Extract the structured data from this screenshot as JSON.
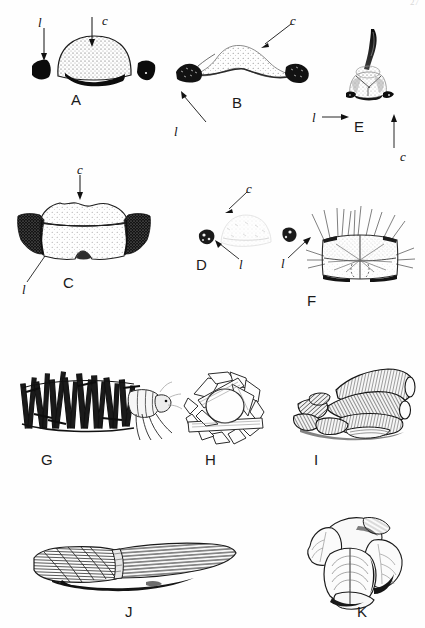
{
  "plate": {
    "kind": "scientific-illustration-plate",
    "background_color": "#fefefe",
    "ink_color": "#111111",
    "width": 425,
    "height": 628,
    "page_number": "27"
  },
  "annotation_legend": {
    "c_label": "c",
    "l_label": "l",
    "c_meaning": "central sclerite / central region",
    "l_meaning": "lateral sclerite"
  },
  "panels": [
    {
      "id": "A",
      "label": "A",
      "subject": "pronotal-sclerite-dorsal-view",
      "description": "Domed stippled central sclerite with dark crescent along its ventral margin and two separate solid-black lateral sclerites.",
      "annotations": [
        {
          "letter": "l",
          "arrow": "down",
          "side": "left"
        },
        {
          "letter": "c",
          "arrow": "down",
          "side": "center"
        }
      ]
    },
    {
      "id": "B",
      "label": "B",
      "subject": "pronotal-sclerite-flattened",
      "description": "Low broad stippled central plate with a pair of solid-black lateral lobes at each end.",
      "annotations": [
        {
          "letter": "c",
          "arrow": "diagonal-down-left",
          "side": "upper-right"
        },
        {
          "letter": "l",
          "arrow": "diagonal-up-right",
          "side": "lower-left"
        }
      ]
    },
    {
      "id": "C",
      "label": "C",
      "subject": "pronotal-sclerite-broad",
      "description": "Large two-tiered stippled central plate with heavily shaded black lateral wings flaring outward and a notch at the ventral midline.",
      "annotations": [
        {
          "letter": "c",
          "arrow": "down",
          "side": "center-top"
        },
        {
          "letter": "l",
          "arrow": "diagonal-up-right",
          "side": "lower-left"
        }
      ]
    },
    {
      "id": "D",
      "label": "D",
      "subject": "pronotal-sclerite-reduced",
      "description": "Very faint pale central plate with two small isolated dark lateral sclerites, one on each side.",
      "annotations": [
        {
          "letter": "c",
          "arrow": "diagonal-down-left",
          "side": "upper-right"
        },
        {
          "letter": "l",
          "arrow": "diagonal-up-left",
          "side": "left"
        },
        {
          "letter": "l",
          "arrow": "diagonal-up-right",
          "side": "right"
        }
      ]
    },
    {
      "id": "E",
      "label": "E",
      "subject": "head-with-dorsal-horn",
      "description": "Frontal view of head bearing a long curved tapering dorsal horn, with small dark lateral sclerites at the ventral corners.",
      "annotations": [
        {
          "letter": "l",
          "arrow": "right",
          "side": "left"
        },
        {
          "letter": "c",
          "arrow": "up",
          "side": "below"
        }
      ]
    },
    {
      "id": "F",
      "label": "F",
      "subject": "sclerotised-segment-with-setae",
      "description": "Roughly rectangular sclerite, grey-shaded along the upper half, divided by a median line, fringed with long radiating setae and bordered below by dark bands.",
      "annotations": []
    },
    {
      "id": "G",
      "label": "G",
      "subject": "larval-case-of-fine-sticks",
      "description": "Lateral view of a caddisfly larva within a tubular case built of many dark slender plant sticks set transversely; head, thorax and legs protrude from the right end.",
      "annotations": []
    },
    {
      "id": "H",
      "label": "H",
      "subject": "larval-case-anterior-view",
      "description": "End-on (anterior) view of a case constructed from flat angular plant fragments arranged around a circular opening.",
      "annotations": []
    },
    {
      "id": "I",
      "label": "I",
      "subject": "larval-case-of-thick-twigs",
      "description": "Case assembled from stout hollow cylindrical plant segments and bark chunks piled lengthwise.",
      "annotations": []
    },
    {
      "id": "J",
      "label": "J",
      "subject": "larval-case-elongate-fibrous",
      "description": "Long slender tapering case made of longitudinally aligned plant fibres and grass blades.",
      "annotations": []
    },
    {
      "id": "K",
      "label": "K",
      "subject": "larval-case-of-leaf-pieces",
      "description": "Compact case built from broad overlapping rounded leaf discs with visible venation.",
      "annotations": []
    }
  ]
}
